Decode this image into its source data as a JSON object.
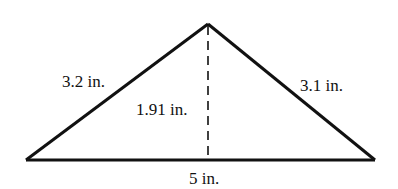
{
  "diagram": {
    "type": "triangle",
    "labels": {
      "left_side": "3.2 in.",
      "right_side": "3.1 in.",
      "height": "1.91 in.",
      "base": "5 in."
    },
    "colors": {
      "stroke": "#111111",
      "background": "#ffffff"
    }
  }
}
